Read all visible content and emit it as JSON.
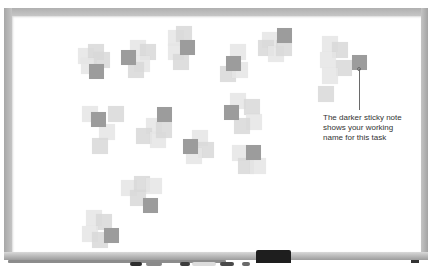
{
  "scene": {
    "description": "Whiteboard with clusters of sticky notes; one darker sticky note per cluster",
    "colors": {
      "frame": "#b4b4b4",
      "board": "#ffffff",
      "light_note": "#e6e6e6",
      "dark_note": "#9c9c9c",
      "eraser": "#1e1e1e",
      "callout_text": "#333333"
    }
  },
  "annotation": {
    "text": "The darker sticky note shows your working name for this task"
  },
  "clusters": [
    {
      "id": "c1",
      "dark": {
        "x": 89,
        "y": 64
      },
      "light": [
        {
          "x": 78,
          "y": 48
        },
        {
          "x": 88,
          "y": 44
        },
        {
          "x": 81,
          "y": 58
        },
        {
          "x": 94,
          "y": 52
        }
      ]
    },
    {
      "id": "c2",
      "dark": {
        "x": 121,
        "y": 50
      },
      "light": [
        {
          "x": 130,
          "y": 40
        },
        {
          "x": 140,
          "y": 44
        },
        {
          "x": 134,
          "y": 56
        },
        {
          "x": 128,
          "y": 62
        }
      ]
    },
    {
      "id": "c3",
      "dark": {
        "x": 180,
        "y": 40
      },
      "light": [
        {
          "x": 168,
          "y": 30
        },
        {
          "x": 176,
          "y": 26
        },
        {
          "x": 168,
          "y": 44
        },
        {
          "x": 173,
          "y": 54
        }
      ]
    },
    {
      "id": "c4",
      "dark": {
        "x": 226,
        "y": 56
      },
      "light": [
        {
          "x": 230,
          "y": 44
        },
        {
          "x": 220,
          "y": 66
        },
        {
          "x": 232,
          "y": 62
        }
      ]
    },
    {
      "id": "c5",
      "dark": {
        "x": 277,
        "y": 28
      },
      "light": [
        {
          "x": 262,
          "y": 32
        },
        {
          "x": 258,
          "y": 40
        },
        {
          "x": 268,
          "y": 46
        },
        {
          "x": 276,
          "y": 40
        }
      ]
    },
    {
      "id": "c6",
      "dark": {
        "x": 352,
        "y": 55
      },
      "light": [
        {
          "x": 322,
          "y": 36
        },
        {
          "x": 332,
          "y": 42
        },
        {
          "x": 320,
          "y": 52
        },
        {
          "x": 336,
          "y": 60
        },
        {
          "x": 322,
          "y": 68
        },
        {
          "x": 318,
          "y": 86
        }
      ]
    },
    {
      "id": "c7",
      "dark": {
        "x": 91,
        "y": 112
      },
      "light": [
        {
          "x": 82,
          "y": 106
        },
        {
          "x": 108,
          "y": 106
        },
        {
          "x": 99,
          "y": 124
        },
        {
          "x": 92,
          "y": 138
        }
      ]
    },
    {
      "id": "c8",
      "dark": {
        "x": 157,
        "y": 107
      },
      "light": [
        {
          "x": 146,
          "y": 118
        },
        {
          "x": 136,
          "y": 128
        },
        {
          "x": 150,
          "y": 132
        },
        {
          "x": 156,
          "y": 122
        }
      ]
    },
    {
      "id": "c9",
      "dark": {
        "x": 183,
        "y": 139
      },
      "light": [
        {
          "x": 192,
          "y": 130
        },
        {
          "x": 198,
          "y": 142
        },
        {
          "x": 186,
          "y": 148
        }
      ]
    },
    {
      "id": "c10",
      "dark": {
        "x": 224,
        "y": 105
      },
      "light": [
        {
          "x": 230,
          "y": 93
        },
        {
          "x": 244,
          "y": 99
        },
        {
          "x": 246,
          "y": 114
        },
        {
          "x": 234,
          "y": 118
        }
      ]
    },
    {
      "id": "c11",
      "dark": {
        "x": 246,
        "y": 145
      },
      "light": [
        {
          "x": 232,
          "y": 145
        },
        {
          "x": 238,
          "y": 158
        },
        {
          "x": 250,
          "y": 158
        }
      ]
    },
    {
      "id": "c12",
      "dark": {
        "x": 143,
        "y": 198
      },
      "light": [
        {
          "x": 121,
          "y": 180
        },
        {
          "x": 134,
          "y": 176
        },
        {
          "x": 146,
          "y": 178
        },
        {
          "x": 130,
          "y": 190
        }
      ]
    },
    {
      "id": "c13",
      "dark": {
        "x": 104,
        "y": 228
      },
      "light": [
        {
          "x": 86,
          "y": 210
        },
        {
          "x": 96,
          "y": 214
        },
        {
          "x": 82,
          "y": 226
        },
        {
          "x": 92,
          "y": 232
        }
      ]
    }
  ],
  "tray_items": {
    "eraser_label": "",
    "markers": [
      {
        "x": 130,
        "w": 12,
        "color": "#2e2e2e"
      },
      {
        "x": 146,
        "w": 16,
        "color": "#8a8a8a"
      },
      {
        "x": 180,
        "w": 10,
        "color": "#3c3c3c"
      },
      {
        "x": 192,
        "w": 24,
        "color": "#dcdcdc"
      },
      {
        "x": 220,
        "w": 14,
        "color": "#4a4a4a"
      },
      {
        "x": 242,
        "w": 8,
        "color": "#6a6a6a"
      }
    ]
  }
}
